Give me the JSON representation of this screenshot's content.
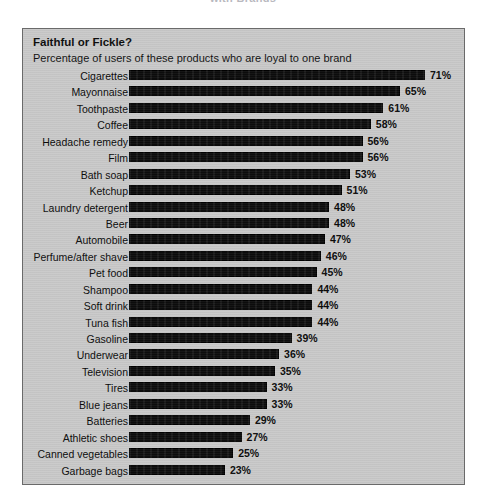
{
  "page_header": "with Brands",
  "chart_data": {
    "type": "bar",
    "orientation": "horizontal",
    "title": "Faithful or Fickle?",
    "subtitle": "Percentage of users of these products who are loyal to one brand",
    "xlabel": "",
    "ylabel": "",
    "xlim": [
      0,
      71
    ],
    "grid": false,
    "legend": false,
    "value_suffix": "%",
    "bar_color": "#0c0c0c",
    "panel_color": "#c9c9c9",
    "categories": [
      "Cigarettes",
      "Mayonnaise",
      "Toothpaste",
      "Coffee",
      "Headache remedy",
      "Film",
      "Bath soap",
      "Ketchup",
      "Laundry detergent",
      "Beer",
      "Automobile",
      "Perfume/after shave",
      "Pet food",
      "Shampoo",
      "Soft drink",
      "Tuna fish",
      "Gasoline",
      "Underwear",
      "Television",
      "Tires",
      "Blue jeans",
      "Batteries",
      "Athletic shoes",
      "Canned vegetables",
      "Garbage bags"
    ],
    "values": [
      71,
      65,
      61,
      58,
      56,
      56,
      53,
      51,
      48,
      48,
      47,
      46,
      45,
      44,
      44,
      44,
      39,
      36,
      35,
      33,
      33,
      29,
      27,
      25,
      23
    ],
    "value_labels": [
      "71%",
      "65%",
      "61%",
      "58%",
      "56%",
      "56%",
      "53%",
      "51%",
      "48%",
      "48%",
      "47%",
      "46%",
      "45%",
      "44%",
      "44%",
      "44%",
      "39%",
      "36%",
      "35%",
      "33%",
      "33%",
      "29%",
      "27%",
      "25%",
      "23%"
    ]
  }
}
